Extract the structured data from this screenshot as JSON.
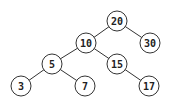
{
  "diagram": {
    "type": "binary-search-tree",
    "nodes": [
      {
        "id": "n20",
        "label": "20",
        "x": 117,
        "y": 21
      },
      {
        "id": "n10",
        "label": "10",
        "x": 86,
        "y": 43
      },
      {
        "id": "n30",
        "label": "30",
        "x": 150,
        "y": 43
      },
      {
        "id": "n5",
        "label": "5",
        "x": 52,
        "y": 64
      },
      {
        "id": "n15",
        "label": "15",
        "x": 117,
        "y": 64
      },
      {
        "id": "n3",
        "label": "3",
        "x": 21,
        "y": 86
      },
      {
        "id": "n7",
        "label": "7",
        "x": 85,
        "y": 86
      },
      {
        "id": "n17",
        "label": "17",
        "x": 149,
        "y": 86
      }
    ],
    "edges": [
      [
        "20",
        "10"
      ],
      [
        "20",
        "30"
      ],
      [
        "10",
        "5"
      ],
      [
        "10",
        "15"
      ],
      [
        "5",
        "3"
      ],
      [
        "5",
        "7"
      ],
      [
        "15",
        "17"
      ]
    ],
    "colors": {
      "stroke": "#333333",
      "fill": "#ffffff",
      "text": "#222222"
    }
  }
}
